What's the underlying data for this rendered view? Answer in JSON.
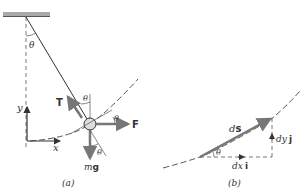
{
  "figure_a": {
    "caption": "(a)",
    "pivot_angle_label": "θ",
    "tension_label": "T",
    "tension_angle_label": "θ",
    "force_label": "F",
    "force_angle_label": "θ",
    "weight_label_m": "m",
    "weight_label_g": "g",
    "weight_angle_label": "θ",
    "axis_y_label": "y",
    "axis_x_label": "x"
  },
  "figure_b": {
    "caption": "(b)",
    "ds_label_d": "d",
    "ds_label_s": "s",
    "angle_label": "θ",
    "dx_label_d": "dx",
    "dx_label_i": "i",
    "dy_label_d": "dy",
    "dy_label_j": "j"
  },
  "colors": {
    "line": "#333333",
    "vector": "#777777",
    "ceiling": "#aaaaaa",
    "ball": "#dddddd"
  }
}
